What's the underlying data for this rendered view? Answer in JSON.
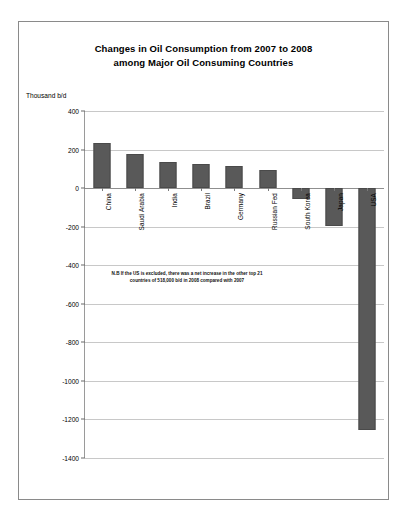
{
  "figure": {
    "title_line1": "Changes in Oil Consumption from 2007 to 2008",
    "title_line2": "among Major Oil Consuming Countries",
    "y_caption": "Thousand b/d",
    "note_line1": "N.B If the US is excluded, there was a net increase in the other top 21",
    "note_line2": "countries of 518,000 b/d in 2008 compared with 2007",
    "bar_color": "#595959",
    "grid_color": "#c8c8c8",
    "frame_color": "#8a8a8a"
  },
  "chart_data": {
    "type": "bar",
    "title": "Changes in Oil Consumption from 2007 to 2008 among Major Oil Consuming Countries",
    "xlabel": "",
    "ylabel": "Thousand b/d",
    "ylim": [
      -1400,
      400
    ],
    "yticks": [
      400,
      200,
      0,
      -200,
      -400,
      -600,
      -800,
      -1000,
      -1200,
      -1400
    ],
    "ytick_labels": [
      "400",
      "200",
      "0",
      "-200",
      "-400",
      "-600",
      "-800",
      "-1000",
      "-1200",
      "-1400"
    ],
    "grid": true,
    "legend": false,
    "categories": [
      "China",
      "Saudi Arabia",
      "India",
      "Brazil",
      "Germany",
      "Russian Fed",
      "South Korea",
      "Japan",
      "USA"
    ],
    "values": [
      235,
      175,
      135,
      125,
      115,
      95,
      -55,
      -195,
      -1255
    ],
    "annotations": [
      "N.B If the US is excluded, there was a net increase in the other top 21 countries of 518,000 b/d in 2008 compared with 2007"
    ]
  }
}
